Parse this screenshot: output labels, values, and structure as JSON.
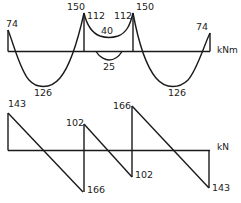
{
  "diagram": {
    "type": "continuous-beam-internal-force-diagrams",
    "spans": 3,
    "supports_x": [
      8,
      84,
      132,
      209
    ]
  },
  "moment_diagram": {
    "unit": "kNm",
    "labels": {
      "left_end": "74",
      "span1_sag": "126",
      "support_b_peak": "150",
      "support_b_face": "112",
      "span2_hog": "40",
      "span2_sag": "25",
      "support_c_face": "112",
      "support_c_peak": "150",
      "span3_sag": "126",
      "right_end": "74"
    },
    "values": {
      "end_moment": 74,
      "support_peak": 150,
      "support_face": 112,
      "end_span_sagging": 126,
      "mid_span_hogging": 40,
      "mid_span_sagging": 25
    }
  },
  "shear_diagram": {
    "unit": "kN",
    "labels": {
      "left_end": "143",
      "support_b_left": "166",
      "support_b_right": "102",
      "support_c_left": "102",
      "support_c_right": "166",
      "right_end": "143"
    },
    "values": {
      "end_reaction_shear": 143,
      "interior_outer_shear": 166,
      "interior_inner_shear": 102
    }
  }
}
